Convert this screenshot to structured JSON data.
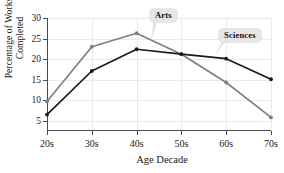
{
  "chart_data": {
    "type": "line",
    "title": "",
    "xlabel": "Age Decade",
    "ylabel_line1": "Percentage of Works",
    "ylabel_line2": "Completed",
    "categories": [
      "20s",
      "30s",
      "40s",
      "50s",
      "60s",
      "70s"
    ],
    "xticklabels": [
      "20s",
      "30s",
      "40s",
      "50s",
      "60s",
      "70s"
    ],
    "yticklabels": [
      "5",
      "10",
      "15",
      "20",
      "25",
      "30"
    ],
    "yticks": [
      5,
      10,
      15,
      20,
      25,
      30
    ],
    "ylim": [
      2.5,
      30
    ],
    "grid": true,
    "legend_position": "inline-callouts",
    "series": [
      {
        "name": "Arts",
        "color": "#7f7f7f",
        "values": [
          9.7,
          23.0,
          26.3,
          21.2,
          14.3,
          5.8
        ]
      },
      {
        "name": "Sciences",
        "color": "#1b1b1b",
        "values": [
          6.5,
          17.1,
          22.4,
          21.2,
          20.1,
          15.1
        ]
      }
    ],
    "annotations": [
      {
        "label": "Arts",
        "points_to_series": "Arts"
      },
      {
        "label": "Sciences",
        "points_to_series": "Sciences"
      }
    ]
  },
  "colors": {
    "arts_line": "#7f7f7f",
    "sciences_line": "#1b1b1b",
    "axis": "#4a4a57",
    "grid": "#e9e9ee",
    "callout_bg": "#e6e6e9",
    "text": "#1b1b1b"
  }
}
